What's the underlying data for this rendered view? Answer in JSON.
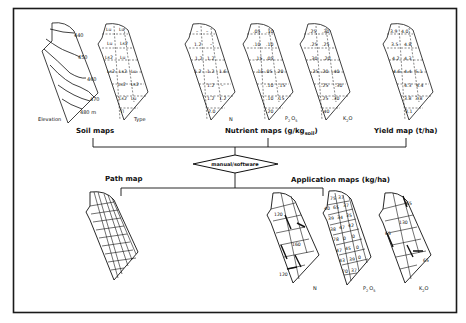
{
  "frame": {
    "stroke": "#1a1a1a",
    "background": "#ffffff"
  },
  "soil_maps": {
    "title": "Soil maps",
    "elevation": {
      "caption": "Elevation",
      "contours": [
        "440",
        "450",
        "460",
        "470",
        "480 m"
      ]
    },
    "type": {
      "caption": "Type",
      "cells": [
        [
          "Lu",
          "Lu"
        ],
        [
          "Lu",
          "Ls2"
        ],
        [
          "Ls2",
          "Lu"
        ],
        [
          "Ls2",
          "Ls2",
          "Lu"
        ],
        [
          "Ls2",
          "Ls2"
        ],
        [
          "Ls2",
          "Lu"
        ],
        [
          "Tl"
        ]
      ]
    }
  },
  "nutrient_maps": {
    "title": "Nutrient maps (g/kg",
    "title_sub": "soil",
    "title_end": ")",
    "maps": [
      {
        "caption": "N",
        "cells": [
          [
            "–",
            "–"
          ],
          [
            "1.2",
            "–"
          ],
          [
            "1.2",
            "1.2"
          ],
          [
            "1.2",
            "1.2",
            "1.6"
          ],
          [
            "1.2",
            "–"
          ],
          [
            "1.2",
            "1.2"
          ],
          [
            "2.0"
          ]
        ]
      },
      {
        "caption": "P2O5",
        "caption_main": "P",
        "caption_sub1": "2",
        "caption_mid": "O",
        "caption_sub2": "5",
        "cells": [
          [
            ".05",
            ".10"
          ],
          [
            ".10",
            ".10"
          ],
          [
            ".15",
            ".05"
          ],
          [
            ".15",
            ".05",
            ".20"
          ],
          [
            ".10",
            ".15"
          ],
          [
            ".10",
            ".15"
          ],
          [
            ".20"
          ]
        ]
      },
      {
        "caption": "K2O",
        "caption_main": "K",
        "caption_sub1": "2",
        "caption_mid": "O",
        "cells": [
          [
            ".25",
            ".30"
          ],
          [
            ".25",
            ".25"
          ],
          [
            ".30",
            ".20"
          ],
          [
            ".25",
            ".20",
            ".40"
          ],
          [
            ".25",
            ".30"
          ],
          [
            ".25",
            ".30"
          ],
          [
            ".40"
          ]
        ]
      }
    ]
  },
  "yield_map": {
    "title": "Yield map (t/ha)",
    "cells": [
      [
        "3.9",
        "4.0"
      ],
      [
        "3.5",
        "4.8"
      ],
      [
        "4.2",
        "4.3"
      ],
      [
        "4.6",
        "4.4",
        "5.1"
      ],
      [
        "4.3",
        "4.4"
      ],
      [
        "3.8",
        "3.8"
      ],
      [
        "3.1"
      ]
    ]
  },
  "decision": {
    "label": "manual/software"
  },
  "path_map": {
    "title": "Path map"
  },
  "application_maps": {
    "title": "Application maps (kg/ha)",
    "maps": [
      {
        "caption": "N",
        "values": [
          "120",
          "160",
          "120"
        ]
      },
      {
        "caption": "P2O5",
        "caption_main": "P",
        "caption_sub1": "2",
        "caption_mid": "O",
        "caption_sub2": "5",
        "values": [
          "75",
          "37",
          "40",
          "65",
          "37",
          "39",
          "34",
          "35",
          "38",
          "47",
          "42",
          "78",
          "0",
          "0",
          "47",
          "45",
          "0",
          "43",
          "39",
          "0",
          "70",
          "37"
        ]
      },
      {
        "caption": "K2O",
        "caption_main": "K",
        "caption_sub1": "2",
        "caption_mid": "O",
        "values": [
          "65",
          "130",
          "65",
          "65"
        ]
      }
    ]
  }
}
